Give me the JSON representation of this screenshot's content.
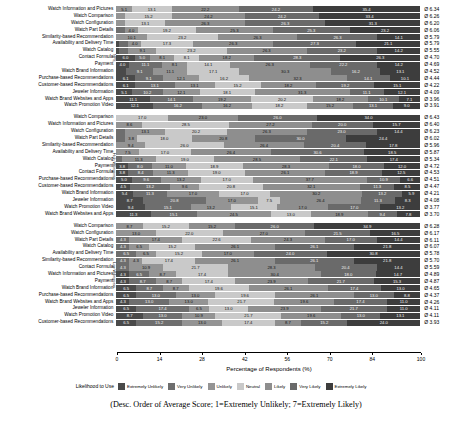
{
  "chart_data": {
    "type": "bar",
    "subtype": "stacked-horizontal-likert",
    "title": "",
    "xlabel": "Percentage of Respondents (%)",
    "ylabel": "",
    "xlim": [
      0,
      100
    ],
    "xticks": [
      0,
      14,
      28,
      42,
      56,
      70,
      84,
      100
    ],
    "grid": false,
    "legend_position": "bottom",
    "legend_title": "Likelihood to Use",
    "caption": "(Desc. Order of Average Score; 1=Extremely Unlikely; 7=Extremely Likely)",
    "series": [
      {
        "name": "Extremely Unlikely",
        "color": "#4a4a4a"
      },
      {
        "name": "Very Unlikely",
        "color": "#6e6e6e"
      },
      {
        "name": "Unlikely",
        "color": "#949494"
      },
      {
        "name": "Neutral",
        "color": "#c9c9c9"
      },
      {
        "name": "Likely",
        "color": "#8e8e8e"
      },
      {
        "name": "Very Likely",
        "color": "#6a6a6a"
      },
      {
        "name": "Extremely Likely",
        "color": "#3d3d3d"
      }
    ],
    "groups": [
      {
        "tag": "NPS",
        "rows": [
          {
            "label": "Watch Information and Pictures",
            "avg": "Ø 6.34",
            "values": [
              0.0,
              0.0,
              5.1,
              13.1,
              22.2,
              24.2,
              35.4
            ]
          },
          {
            "label": "Watch Comparison",
            "avg": "Ø 6.26",
            "values": [
              0.0,
              0.0,
              3.0,
              15.2,
              24.2,
              24.2,
              33.4
            ]
          },
          {
            "label": "Watch Configuration",
            "avg": "Ø 6.20",
            "values": [
              0.0,
              0.0,
              3.0,
              13.1,
              26.3,
              26.3,
              31.3
            ]
          },
          {
            "label": "Watch Part Details",
            "avg": "Ø 6.06",
            "values": [
              0.0,
              3.0,
              4.0,
              19.2,
              25.3,
              25.3,
              23.2
            ]
          },
          {
            "label": "Similarity-based Recommendation",
            "avg": "Ø 5.79",
            "values": [
              0.0,
              0.0,
              10.1,
              23.2,
              26.3,
              26.3,
              14.1
            ]
          },
          {
            "label": "Availability and Delivery Time",
            "avg": "Ø 5.79",
            "values": [
              1.0,
              3.0,
              4.0,
              17.3,
              26.3,
              27.3,
              21.1
            ]
          },
          {
            "label": "Watch Catalog",
            "avg": "Ø 5.55",
            "values": [
              1.0,
              3.0,
              9.1,
              23.2,
              26.3,
              23.2,
              14.2
            ]
          },
          {
            "label": "Contact Formula",
            "avg": "Ø 4.70",
            "values": [
              6.0,
              5.0,
              8.1,
              8.1,
              18.2,
              28.3,
              26.3
            ]
          },
          {
            "label": "Payment",
            "avg": "Ø 4.69",
            "values": [
              4.0,
              11.1,
              8.1,
              14.1,
              26.3,
              22.2,
              14.2
            ]
          },
          {
            "label": "Watch Brand Information",
            "avg": "Ø 4.52",
            "values": [
              3.1,
              9.1,
              11.1,
              17.1,
              30.3,
              16.2,
              13.1
            ]
          },
          {
            "label": "Purchase-based Recommendations",
            "avg": "Ø 4.44",
            "values": [
              6.1,
              9.1,
              12.1,
              16.2,
              32.3,
              14.1,
              10.1
            ]
          },
          {
            "label": "Customer-based Recommendations",
            "avg": "Ø 4.22",
            "values": [
              6.1,
              13.1,
              13.1,
              15.2,
              18.2,
              19.2,
              15.1
            ]
          },
          {
            "label": "Jeweler Information",
            "avg": "Ø 4.09",
            "values": [
              5.1,
              10.2,
              12.1,
              18.1,
              31.3,
              11.1,
              12.1
            ]
          },
          {
            "label": "Watch Brand Websites and Apps",
            "avg": "Ø 3.96",
            "values": [
              11.1,
              14.1,
              19.2,
              20.2,
              18.2,
              10.1,
              7.1
            ]
          },
          {
            "label": "Watch Promotion Video",
            "avg": "Ø 3.91",
            "values": [
              12.1,
              16.2,
              16.2,
              18.2,
              15.2,
              13.1,
              9.0
            ]
          }
        ]
      },
      {
        "tag": "High Willingness",
        "rows": [
          {
            "label": "Watch Comparison",
            "avg": "Ø 6.43",
            "values": [
              0.0,
              0.0,
              0.0,
              17.0,
              23.0,
              26.0,
              34.0
            ]
          },
          {
            "label": "Watch Information and Pictures",
            "avg": "Ø 6.40",
            "values": [
              0.0,
              0.0,
              8.6,
              28.5,
              27.2,
              20.0,
              15.7
            ]
          },
          {
            "label": "Watch Configuration",
            "avg": "Ø 6.23",
            "values": [
              0.0,
              3.0,
              13.1,
              20.2,
              26.3,
              23.0,
              14.4
            ]
          },
          {
            "label": "Watch Part Details",
            "avg": "Ø 6.02",
            "values": [
              0.0,
              3.0,
              3.8,
              18.0,
              20.8,
              30.0,
              24.4
            ]
          },
          {
            "label": "Similarity-based Recommendation",
            "avg": "Ø 5.96",
            "values": [
              0.0,
              0.0,
              9.4,
              26.0,
              26.4,
              20.4,
              17.8
            ]
          },
          {
            "label": "Availability and Delivery Time",
            "avg": "Ø 5.87",
            "values": [
              0.0,
              0.0,
              7.5,
              17.0,
              26.4,
              30.6,
              18.5
            ]
          },
          {
            "label": "Watch Catalog",
            "avg": "Ø 5.34",
            "values": [
              0.0,
              1.7,
              11.3,
              19.0,
              28.5,
              22.1,
              17.4
            ]
          },
          {
            "label": "Payment",
            "avg": "Ø 4.72",
            "values": [
              3.8,
              8.0,
              11.0,
              18.9,
              28.3,
              18.0,
              12.0
            ]
          },
          {
            "label": "Contact Formula",
            "avg": "Ø 4.53",
            "values": [
              3.8,
              8.4,
              11.3,
              19.0,
              26.1,
              18.9,
              12.5
            ]
          },
          {
            "label": "Purchase-based Recommendations",
            "avg": "Ø 4.51",
            "values": [
              5.0,
              9.6,
              13.2,
              17.0,
              37.7,
              10.9,
              6.6
            ]
          },
          {
            "label": "Customer-based Recommendations",
            "avg": "Ø 4.47",
            "values": [
              4.5,
              13.2,
              9.6,
              20.8,
              32.1,
              11.3,
              8.5
            ]
          },
          {
            "label": "Watch Brand Information",
            "avg": "Ø 4.21",
            "values": [
              5.4,
              11.3,
              17.0,
              17.0,
              30.2,
              13.2,
              5.9
            ]
          },
          {
            "label": "Jeweler Information",
            "avg": "Ø 4.08",
            "values": [
              8.7,
              20.8,
              17.0,
              7.5,
              26.4,
              11.3,
              8.3
            ]
          },
          {
            "label": "Watch Promotion Video",
            "avg": "Ø 3.77",
            "values": [
              9.4,
              15.1,
              13.2,
              15.1,
              17.0,
              17.0,
              13.2
            ]
          },
          {
            "label": "Watch Brand Websites and Apps",
            "avg": "Ø 3.70",
            "values": [
              11.3,
              15.1,
              24.5,
              13.0,
              18.9,
              9.4,
              7.8
            ]
          }
        ]
      },
      {
        "tag": "Low Willingness",
        "rows": [
          {
            "label": "Watch Comparison",
            "avg": "Ø 6.28",
            "values": [
              0.0,
              0.0,
              8.7,
              15.2,
              15.2,
              26.0,
              34.9
            ]
          },
          {
            "label": "Watch Configuration",
            "avg": "Ø 6.17",
            "values": [
              0.0,
              0.0,
              13.0,
              22.0,
              27.0,
              21.5,
              16.5
            ]
          },
          {
            "label": "Watch Part Details",
            "avg": "Ø 6.11",
            "values": [
              0.0,
              4.3,
              17.4,
              22.6,
              24.3,
              17.0,
              14.4
            ]
          },
          {
            "label": "Watch Catalog",
            "avg": "Ø 6.07",
            "values": [
              0.0,
              4.3,
              6.5,
              15.2,
              26.1,
              26.1,
              21.8
            ]
          },
          {
            "label": "Availability and Delivery Time",
            "avg": "Ø 5.78",
            "values": [
              0.0,
              6.5,
              6.5,
              15.2,
              17.0,
              24.0,
              30.8
            ]
          },
          {
            "label": "Similarity-based Recommendation",
            "avg": "Ø 5.70",
            "values": [
              0.0,
              4.3,
              4.3,
              17.4,
              26.1,
              26.1,
              21.8
            ]
          },
          {
            "label": "Contact Formula",
            "avg": "Ø 5.59",
            "values": [
              0.0,
              4.3,
              10.9,
              21.7,
              28.3,
              20.4,
              14.4
            ]
          },
          {
            "label": "Watch Information and Pictures",
            "avg": "Ø 4.89",
            "values": [
              4.3,
              6.5,
              8.7,
              17.4,
              30.4,
              18.0,
              14.7
            ]
          },
          {
            "label": "Payment",
            "avg": "Ø 4.87",
            "values": [
              4.3,
              8.7,
              8.7,
              17.4,
              23.9,
              21.7,
              15.3
            ]
          },
          {
            "label": "Watch Brand Information",
            "avg": "Ø 4.65",
            "values": [
              6.5,
              8.7,
              8.7,
              19.6,
              26.1,
              17.4,
              13.0
            ]
          },
          {
            "label": "Purchase-based Recommendations",
            "avg": "Ø 4.37",
            "values": [
              6.5,
              13.0,
              13.0,
              19.6,
              26.1,
              13.0,
              8.8
            ]
          },
          {
            "label": "Watch Brand Websites and Apps",
            "avg": "Ø 4.26",
            "values": [
              4.3,
              13.0,
              13.0,
              21.7,
              19.6,
              17.4,
              11.0
            ]
          },
          {
            "label": "Jeweler Information",
            "avg": "Ø 4.11",
            "values": [
              6.5,
              17.4,
              6.5,
              13.0,
              23.9,
              21.7,
              11.0
            ]
          },
          {
            "label": "Watch Promotion Video",
            "avg": "Ø 4.11",
            "values": [
              8.7,
              13.0,
              10.9,
              21.7,
              19.6,
              13.0,
              13.1
            ]
          },
          {
            "label": "Customer-based Recommendations",
            "avg": "Ø 3.93",
            "values": [
              6.5,
              15.2,
              13.0,
              17.4,
              8.7,
              15.2,
              24.0
            ]
          }
        ]
      }
    ]
  }
}
